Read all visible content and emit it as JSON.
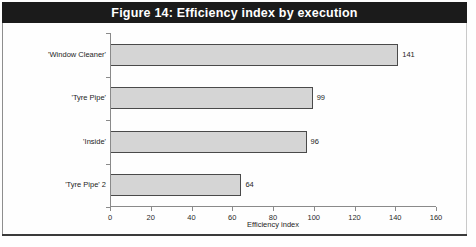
{
  "figure": {
    "title": "Figure 14: Efficiency index by execution",
    "title_bar_color": "#1b1b1b",
    "title_text_color": "#ffffff",
    "background_color": "#fefefe",
    "bar_fill_color": "#d5d5d5",
    "bar_border_color": "#4a4a4a",
    "axis_color": "#8a8a8a"
  },
  "chart_data": {
    "type": "bar",
    "orientation": "horizontal",
    "title": "Figure 14: Efficiency index by execution",
    "subtitle": "",
    "categories": [
      "'Window Cleaner'",
      "'Tyre Pipe'",
      "'Inside'",
      "'Tyre Pipe' 2"
    ],
    "values": [
      141,
      99,
      96,
      64
    ],
    "data_labels": [
      "141",
      "99",
      "96",
      "64"
    ],
    "xlabel": "Efficiency index",
    "ylabel": "",
    "xlim": [
      0,
      160
    ],
    "ylim": null,
    "xticks": [
      0,
      20,
      40,
      60,
      80,
      100,
      120,
      140,
      160
    ],
    "xtick_labels": [
      "0",
      "20",
      "40",
      "60",
      "80",
      "100",
      "120",
      "140",
      "160"
    ],
    "grid": false,
    "legend": null,
    "legend_position": "none",
    "annotations": []
  }
}
